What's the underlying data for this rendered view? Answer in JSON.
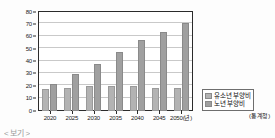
{
  "chart_data": {
    "type": "bar",
    "title": "",
    "xlabel": "",
    "ylabel": "",
    "ylim": [
      0,
      80
    ],
    "yticks": [
      0,
      10,
      20,
      30,
      40,
      50,
      60,
      70,
      80
    ],
    "grid": true,
    "legend_position": "lower-right-outside",
    "categories": [
      "2020",
      "2025",
      "2030",
      "2035",
      "2040",
      "2045",
      "2050"
    ],
    "x_axis_unit_label": "2050(년)",
    "series": [
      {
        "name": "유소년 부양비",
        "color": "#b3b3b3",
        "values": [
          18,
          19,
          20,
          20,
          20,
          19,
          19
        ]
      },
      {
        "name": "노년 부양비",
        "color": "#a0a0a0",
        "values": [
          22,
          30,
          38,
          48,
          57,
          64,
          71
        ]
      }
    ],
    "source": "(통계청)"
  },
  "axis": {
    "y_ticks": [
      "0",
      "10",
      "20",
      "30",
      "40",
      "50",
      "60",
      "70",
      "80"
    ],
    "x_labels": [
      "2020",
      "2025",
      "2030",
      "2035",
      "2040",
      "2045",
      "2050(년)"
    ]
  },
  "legend": {
    "items": [
      {
        "label": "유소년 부양비"
      },
      {
        "label": "노년 부양비"
      }
    ]
  },
  "source_note": "(통계청)",
  "bottom_caption": "< 보기 >"
}
